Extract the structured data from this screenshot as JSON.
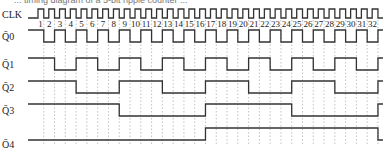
{
  "title_fragment": "... timing diagram of a 5-bit ripple counter ...",
  "clock": {
    "label": "CLK",
    "periods": 32
  },
  "ticks": [
    "1",
    "2",
    "3",
    "4",
    "5",
    "6",
    "7",
    "8",
    "9",
    "10",
    "11",
    "12",
    "13",
    "14",
    "15",
    "16",
    "17",
    "18",
    "19",
    "20",
    "21",
    "22",
    "23",
    "24",
    "25",
    "26",
    "27",
    "28",
    "29",
    "30",
    "31",
    "32"
  ],
  "signals": [
    {
      "label": "Q̄0",
      "toggle_every": 1,
      "start_high": true,
      "y_high": 30,
      "y_low": 42
    },
    {
      "label": "Q̄1",
      "toggle_every": 2,
      "start_high": true,
      "y_high": 58,
      "y_low": 70
    },
    {
      "label": "Q̄2",
      "toggle_every": 4,
      "start_high": true,
      "y_high": 81,
      "y_low": 93
    },
    {
      "label": "Q̄3",
      "toggle_every": 8,
      "start_high": true,
      "y_high": 104,
      "y_low": 116
    },
    {
      "label": "Q̄4",
      "toggle_every": 16,
      "start_high": false,
      "y_high": 128,
      "y_low": 140
    }
  ],
  "geometry": {
    "x0": 36,
    "period": 10.78,
    "clk_high": 9,
    "clk_low": 18,
    "tick_y": 27
  }
}
